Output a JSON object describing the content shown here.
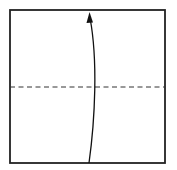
{
  "diagram": {
    "type": "origami-fold-step",
    "paper": {
      "shape": "square",
      "x": 10,
      "y": 10,
      "width": 155,
      "height": 153,
      "stroke": "#222222",
      "fill": "#ffffff"
    },
    "fold_lines": [
      {
        "kind": "valley-fold",
        "style": "dashed",
        "x1": 10,
        "y1": 87,
        "x2": 165,
        "y2": 87,
        "stroke": "#333333"
      }
    ],
    "arrows": [
      {
        "kind": "fold-direction",
        "direction": "up",
        "path": "M 89 163 C 95 120, 98 60, 90 16",
        "stroke": "#111111",
        "head_at": {
          "x": 90,
          "y": 13
        }
      }
    ],
    "labels": []
  }
}
